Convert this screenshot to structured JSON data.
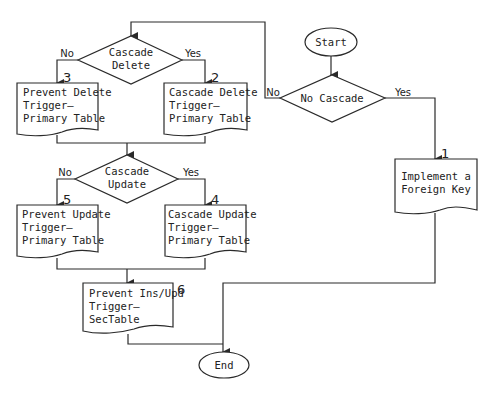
{
  "diagram": {
    "start": {
      "label": "Start"
    },
    "end": {
      "label": "End"
    },
    "decisions": {
      "no_cascade": {
        "label": "No Cascade",
        "yes": "Yes",
        "no": "No"
      },
      "cascade_delete": {
        "line1": "Cascade",
        "line2": "Delete",
        "yes": "Yes",
        "no": "No"
      },
      "cascade_update": {
        "line1": "Cascade",
        "line2": "Update",
        "yes": "Yes",
        "no": "No"
      }
    },
    "steps": {
      "s1": {
        "number": "1",
        "line1": "Implement a",
        "line2": "Foreign Key"
      },
      "s2": {
        "number": "2",
        "line1": "Cascade Delete",
        "line2": "Trigger—",
        "line3": "Primary Table"
      },
      "s3": {
        "number": "3",
        "line1": "Prevent Delete",
        "line2": "Trigger—",
        "line3": "Primary Table"
      },
      "s4": {
        "number": "4",
        "line1": "Cascade Update",
        "line2": "Trigger—",
        "line3": "Primary Table"
      },
      "s5": {
        "number": "5",
        "line1": "Prevent Update",
        "line2": "Trigger—",
        "line3": "Primary Table"
      },
      "s6": {
        "number": "6",
        "line1": "Prevent Ins/Upd",
        "line2": "Trigger—",
        "line3": "SecTable"
      }
    }
  }
}
